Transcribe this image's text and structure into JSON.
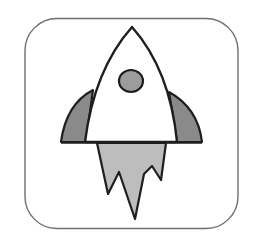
{
  "icon": {
    "name": "rocket-icon",
    "colors": {
      "background": "#ffffff",
      "frame_stroke": "#6e6e6e",
      "outline": "#1e1e1e",
      "body_fill": "#ffffff",
      "fin_fill": "#8a8a8a",
      "window_fill": "#9c9c9c",
      "flame_fill": "#bdbdbd"
    }
  }
}
